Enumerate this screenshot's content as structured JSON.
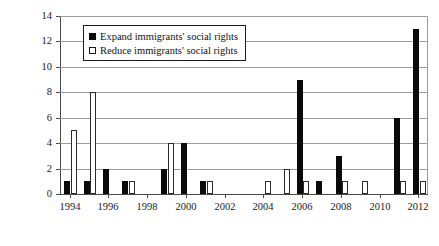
{
  "chart_data": {
    "type": "bar",
    "title": "",
    "subtitle": "",
    "xlabel": "",
    "ylabel": "",
    "ylim": [
      0,
      14
    ],
    "ytick_step": 2,
    "yticks": [
      "0",
      "2",
      "4",
      "6",
      "8",
      "10",
      "12",
      "14"
    ],
    "grid": true,
    "legend_position": "top-left-inside",
    "categories": [
      "1994",
      "1995",
      "1996",
      "1997",
      "1998",
      "1999",
      "2000",
      "2001",
      "2002",
      "2003",
      "2004",
      "2005",
      "2006",
      "2007",
      "2008",
      "2009",
      "2010",
      "2011",
      "2012"
    ],
    "xtick_labels": [
      "1994",
      "1996",
      "1998",
      "2000",
      "2002",
      "2004",
      "2006",
      "2008",
      "2010",
      "2012"
    ],
    "series": [
      {
        "name": "Expand immigrants' social rights",
        "color": "#0a0a0a",
        "style": "filled",
        "values": [
          1,
          1,
          2,
          1,
          0,
          2,
          4,
          1,
          0,
          0,
          0,
          0,
          9,
          1,
          3,
          0,
          0,
          6,
          13
        ]
      },
      {
        "name": "Reduce immigrants' social rights",
        "color": "#ffffff",
        "style": "open",
        "values": [
          5,
          8,
          0,
          1,
          0,
          4,
          0,
          1,
          0,
          0,
          1,
          2,
          1,
          0,
          1,
          1,
          0,
          1,
          1
        ]
      }
    ]
  },
  "legend": {
    "items": [
      {
        "label": "Expand immigrants' social rights",
        "swatch": "filled-square-icon"
      },
      {
        "label": "Reduce immigrants' social rights",
        "swatch": "open-square-icon"
      }
    ]
  },
  "axis": {
    "y_labels": [
      "14",
      "12",
      "10",
      "8",
      "6",
      "4",
      "2",
      "0"
    ],
    "x_labels": [
      "1994",
      "1996",
      "1998",
      "2000",
      "2002",
      "2004",
      "2006",
      "2008",
      "2010",
      "2012"
    ]
  },
  "colors": {
    "expand": "#0a0a0a",
    "reduce": "#ffffff",
    "axis": "#4a4a4a",
    "grid": "#9c9c9c",
    "text": "#1a1a1a",
    "background": "#ffffff"
  }
}
